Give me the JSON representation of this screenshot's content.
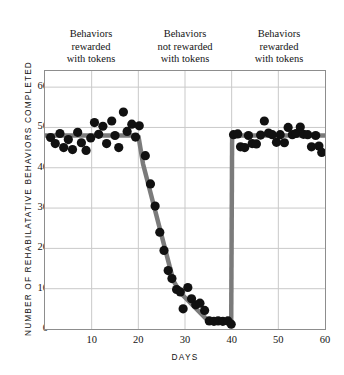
{
  "figure": {
    "phase_captions": [
      {
        "lines": [
          "Behaviors",
          "rewarded",
          "with tokens"
        ]
      },
      {
        "lines": [
          "Behaviors",
          "not rewarded",
          "with tokens"
        ]
      },
      {
        "lines": [
          "Behaviors",
          "rewarded",
          "with tokens"
        ]
      }
    ]
  },
  "chart_data": {
    "type": "scatter",
    "title": "",
    "subtitle": "",
    "xlabel": "DAYS",
    "ylabel": "NUMBER OF REHABILATATIVE BEHAVIORS COMPLETED",
    "xlim": [
      0,
      60
    ],
    "ylim": [
      0,
      64
    ],
    "xticks": [
      10,
      20,
      30,
      40,
      50,
      60
    ],
    "yticks": [
      0,
      10,
      20,
      30,
      40,
      50,
      60
    ],
    "xtick_labels": [
      "10",
      "20",
      "30",
      "40",
      "50",
      "60"
    ],
    "ytick_labels": [
      "0",
      "10",
      "20",
      "30",
      "40",
      "50",
      "60"
    ],
    "grid": true,
    "grid_color": "#c9c9c9",
    "legend": "none",
    "point_color": "#111111",
    "point_size": 4.6,
    "trend_color": "#7b7b7b",
    "trend_width": 4.5,
    "annotations": [
      {
        "text": "Behaviors rewarded with tokens",
        "x_range": [
          0,
          20
        ]
      },
      {
        "text": "Behaviors not rewarded with tokens",
        "x_range": [
          20,
          40
        ]
      },
      {
        "text": "Behaviors rewarded with tokens",
        "x_range": [
          40,
          60
        ]
      }
    ],
    "series": [
      {
        "name": "Rehabilitative behaviors completed",
        "points": [
          [
            1.2,
            47.5
          ],
          [
            2.2,
            46.0
          ],
          [
            3.2,
            48.5
          ],
          [
            4.0,
            45.0
          ],
          [
            5.0,
            47.0
          ],
          [
            5.9,
            44.5
          ],
          [
            7.0,
            48.8
          ],
          [
            7.8,
            46.2
          ],
          [
            8.8,
            44.3
          ],
          [
            9.8,
            47.4
          ],
          [
            10.6,
            51.2
          ],
          [
            11.5,
            48.3
          ],
          [
            12.4,
            50.3
          ],
          [
            13.2,
            46.0
          ],
          [
            14.3,
            51.6
          ],
          [
            15.0,
            48.0
          ],
          [
            15.8,
            45.0
          ],
          [
            16.8,
            53.8
          ],
          [
            17.6,
            49.0
          ],
          [
            18.6,
            50.8
          ],
          [
            19.4,
            47.6
          ],
          [
            20.2,
            50.4
          ],
          [
            21.5,
            43.0
          ],
          [
            22.6,
            36.0
          ],
          [
            23.6,
            30.5
          ],
          [
            24.6,
            24.0
          ],
          [
            25.5,
            19.5
          ],
          [
            26.4,
            14.5
          ],
          [
            27.2,
            12.5
          ],
          [
            28.2,
            9.8
          ],
          [
            29.0,
            9.2
          ],
          [
            29.6,
            5.0
          ],
          [
            30.6,
            10.3
          ],
          [
            31.4,
            7.5
          ],
          [
            32.3,
            6.0
          ],
          [
            33.2,
            6.4
          ],
          [
            34.2,
            4.6
          ],
          [
            35.2,
            2.0
          ],
          [
            36.2,
            1.9
          ],
          [
            37.1,
            2.0
          ],
          [
            38.1,
            1.9
          ],
          [
            39.2,
            2.0
          ],
          [
            39.9,
            1.2
          ],
          [
            40.4,
            48.2
          ],
          [
            41.3,
            48.4
          ],
          [
            41.9,
            45.2
          ],
          [
            42.8,
            45.0
          ],
          [
            43.6,
            48.0
          ],
          [
            44.4,
            46.0
          ],
          [
            45.3,
            45.9
          ],
          [
            46.2,
            48.1
          ],
          [
            47.0,
            51.6
          ],
          [
            47.9,
            48.6
          ],
          [
            48.7,
            48.2
          ],
          [
            49.6,
            46.3
          ],
          [
            50.4,
            48.2
          ],
          [
            51.3,
            46.2
          ],
          [
            52.1,
            50.0
          ],
          [
            53.0,
            48.2
          ],
          [
            53.8,
            48.5
          ],
          [
            54.7,
            50.1
          ],
          [
            55.4,
            48.3
          ],
          [
            56.3,
            48.2
          ],
          [
            57.1,
            45.2
          ],
          [
            58.0,
            48.0
          ],
          [
            58.7,
            45.4
          ],
          [
            59.3,
            43.8
          ]
        ]
      }
    ],
    "trend_segments": [
      {
        "name": "baseline-phase-1",
        "points": [
          [
            0,
            48.0
          ],
          [
            20.0,
            48.0
          ]
        ]
      },
      {
        "name": "extinction-drop",
        "points": [
          [
            20.0,
            48.0
          ],
          [
            21.0,
            41.0
          ],
          [
            27.5,
            12.0
          ],
          [
            29.0,
            9.0
          ],
          [
            35.0,
            2.0
          ],
          [
            39.9,
            1.6
          ]
        ]
      },
      {
        "name": "reinstatement-jump",
        "points": [
          [
            39.9,
            1.6
          ],
          [
            40.1,
            48.0
          ]
        ]
      },
      {
        "name": "baseline-phase-3",
        "points": [
          [
            40.1,
            48.0
          ],
          [
            60.0,
            48.0
          ]
        ]
      }
    ]
  }
}
